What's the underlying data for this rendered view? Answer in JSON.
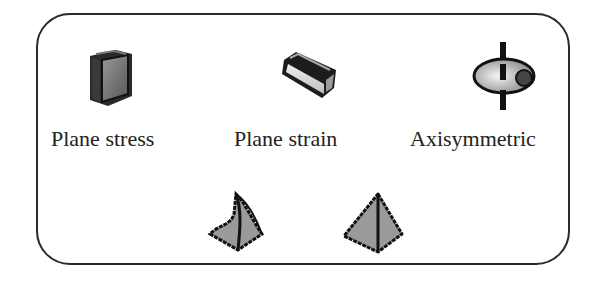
{
  "panel": {
    "options": [
      {
        "label": "Plane stress",
        "icon": "plane-stress-icon"
      },
      {
        "label": "Plane strain",
        "icon": "plane-strain-icon"
      },
      {
        "label": "Axisymmetric",
        "icon": "axisymmetric-icon"
      }
    ],
    "elements": [
      {
        "icon": "curved-tetrahedron-icon"
      },
      {
        "icon": "tetrahedron-icon"
      }
    ]
  },
  "colors": {
    "border": "#2a2a2a",
    "icon_fill": "#8a8a8a",
    "icon_outline": "#1a1a1a",
    "text": "#222222"
  }
}
